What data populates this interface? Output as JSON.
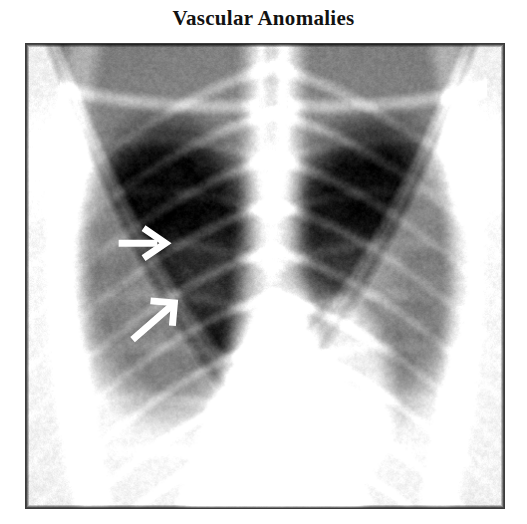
{
  "figure": {
    "title": "Vascular Anomalies",
    "modality": "chest-radiograph",
    "view": "frontal-pa",
    "border_color": "#3a3a3a",
    "background_color": "#ffffff"
  },
  "image": {
    "frame": {
      "x": 25,
      "y": 43,
      "width": 480,
      "height": 466
    },
    "tones": {
      "lung_field_dark": "#0b0b0b",
      "rib_bright": "#b9b9b9",
      "mediastinum": "#cfcfcf",
      "soft_tissue": "#8a8a8a",
      "diaphragm": "#d6d6d6",
      "film_edge": "#101010"
    },
    "anatomy": [
      {
        "name": "right-lung-field",
        "side": "right",
        "tone": "dark"
      },
      {
        "name": "left-lung-field",
        "side": "left",
        "tone": "dark"
      },
      {
        "name": "mediastinum",
        "side": "center",
        "tone": "bright"
      },
      {
        "name": "trachea",
        "side": "center",
        "tone": "dark"
      },
      {
        "name": "spine",
        "side": "center",
        "tone": "bright"
      },
      {
        "name": "cardiac-silhouette",
        "side": "left",
        "tone": "bright"
      },
      {
        "name": "right-hemidiaphragm",
        "side": "right",
        "tone": "bright"
      },
      {
        "name": "left-hemidiaphragm",
        "side": "left",
        "tone": "bright"
      },
      {
        "name": "clavicles",
        "side": "both",
        "tone": "bright"
      },
      {
        "name": "posterior-ribs",
        "side": "both",
        "tone": "bright"
      },
      {
        "name": "anterior-ribs",
        "side": "both",
        "tone": "bright"
      }
    ]
  },
  "annotations": {
    "arrow_color": "#ffffff",
    "items": [
      {
        "id": "arrow-upper",
        "direction": "right",
        "label": "upper-marker-arrow",
        "tail": {
          "x": 118,
          "y": 243
        },
        "head": {
          "x": 163,
          "y": 243
        }
      },
      {
        "id": "arrow-lower",
        "direction": "up-right",
        "label": "lower-marker-arrow",
        "tail": {
          "x": 132,
          "y": 340
        },
        "head": {
          "x": 172,
          "y": 305
        }
      }
    ]
  }
}
